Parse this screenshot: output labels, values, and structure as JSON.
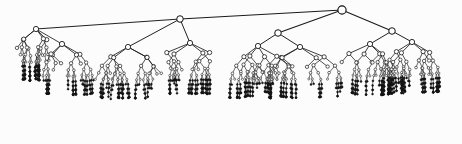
{
  "figure": {
    "kind": "node-link-tree",
    "width": 462,
    "height": 144,
    "background_color": "#fcfcfc",
    "edge_color": "#1a1a1a",
    "node_fill": "#ffffff",
    "node_stroke": "#111111",
    "leaf_fill": "#141414",
    "root": {
      "x": 342,
      "y": 10
    },
    "max_depth": 9
  },
  "tree_params": {
    "root_x": 342,
    "root_y": 10,
    "level_step_base": 13.5,
    "level_step_decay": 0.84,
    "level_step_min": 4.0,
    "radius_base": 4.1,
    "radius_decay": 0.8,
    "radius_min": 0.95,
    "stroke_base": 1.25,
    "stroke_decay": 0.88,
    "stroke_min": 0.55,
    "leaf_depth_threshold": 7,
    "spread_base": 170,
    "spread_decay": 0.455,
    "seed": 20240613,
    "jitter_x": 0.22,
    "jitter_y": 0.16,
    "branch_prob_base": 0.97,
    "branch_prob_decay": 0.955,
    "single_child_prob": 0.2,
    "x_min": 12,
    "x_max": 450,
    "y_max": 138
  },
  "structure": {
    "description": "Root near top-center-right with three long shallow links: one far left, one mid, one right.",
    "top_children": [
      {
        "label": "left-branch",
        "x": 180,
        "y": 19
      },
      {
        "label": "center-branch",
        "x": 278,
        "y": 33
      },
      {
        "label": "right-branch",
        "x": 392,
        "y": 31
      }
    ],
    "secondary_nodes": [
      {
        "label": "left-hub",
        "x": 36,
        "y": 29
      },
      {
        "label": "left-inner-hub",
        "x": 62,
        "y": 44
      },
      {
        "label": "mid-left-hub",
        "x": 128,
        "y": 47
      },
      {
        "label": "mid-hub",
        "x": 190,
        "y": 43
      },
      {
        "label": "center-left-hub",
        "x": 258,
        "y": 46
      },
      {
        "label": "center-right-hub",
        "x": 300,
        "y": 47
      },
      {
        "label": "right-hub",
        "x": 370,
        "y": 44
      },
      {
        "label": "far-right-hub",
        "x": 412,
        "y": 42
      }
    ]
  },
  "legend": {
    "visible": false,
    "items": []
  },
  "labels": {
    "visible": false,
    "text": ""
  }
}
